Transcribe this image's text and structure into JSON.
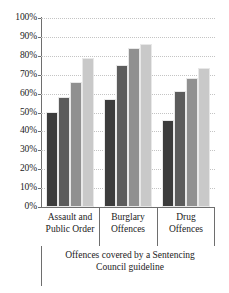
{
  "chart_data": {
    "type": "bar",
    "title": "",
    "xlabel": "Offences covered by a Sentencing Council guideline",
    "ylabel": "",
    "categories": [
      "Assault and Public Order",
      "Burglary Offences",
      "Drug Offences"
    ],
    "category_lines": [
      [
        "Assault and",
        "Public Order"
      ],
      [
        "Burglary",
        "Offences"
      ],
      [
        "Drug",
        "Offences"
      ]
    ],
    "series": [
      {
        "name": "series-1",
        "color": "#3c3c3c",
        "values": [
          50.5,
          57.0,
          46.0
        ]
      },
      {
        "name": "series-2",
        "color": "#5c5c5c",
        "values": [
          58.0,
          75.0,
          61.5
        ]
      },
      {
        "name": "series-3",
        "color": "#909090",
        "values": [
          66.0,
          84.0,
          68.5
        ]
      },
      {
        "name": "series-4",
        "color": "#c9c9c9",
        "values": [
          79.0,
          86.5,
          73.5
        ]
      }
    ],
    "ylim": [
      0,
      100
    ],
    "ytick_labels": [
      "100%",
      "90%",
      "80%",
      "70%",
      "60%",
      "50%",
      "40%",
      "30%",
      "20%",
      "10%",
      "0%"
    ],
    "ytick_values": [
      100,
      90,
      80,
      70,
      60,
      50,
      40,
      30,
      20,
      10,
      0
    ],
    "grid": true,
    "legend": "none"
  }
}
